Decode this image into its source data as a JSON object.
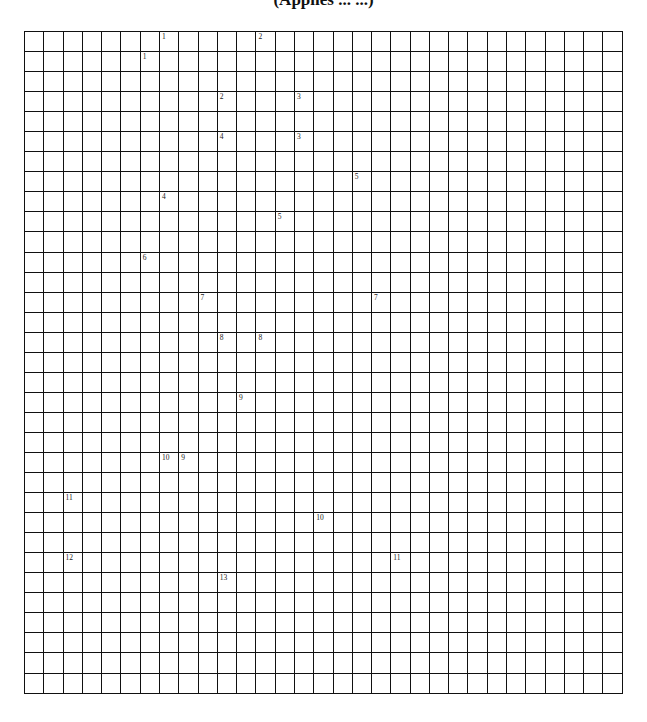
{
  "header": {
    "title": "(Applies ... ...)"
  },
  "puzzle": {
    "type": "crossword-grid",
    "columns": 31,
    "rows": 33,
    "numbers": [
      {
        "label": "1",
        "row": 0,
        "col": 7
      },
      {
        "label": "2",
        "row": 0,
        "col": 12
      },
      {
        "label": "1",
        "row": 1,
        "col": 6
      },
      {
        "label": "2",
        "row": 3,
        "col": 10
      },
      {
        "label": "3",
        "row": 3,
        "col": 14
      },
      {
        "label": "4",
        "row": 5,
        "col": 10
      },
      {
        "label": "3",
        "row": 5,
        "col": 14
      },
      {
        "label": "5",
        "row": 7,
        "col": 17
      },
      {
        "label": "4",
        "row": 8,
        "col": 7
      },
      {
        "label": "5",
        "row": 9,
        "col": 13
      },
      {
        "label": "6",
        "row": 11,
        "col": 6
      },
      {
        "label": "7",
        "row": 13,
        "col": 9
      },
      {
        "label": "7",
        "row": 13,
        "col": 18
      },
      {
        "label": "8",
        "row": 15,
        "col": 10
      },
      {
        "label": "8",
        "row": 15,
        "col": 12
      },
      {
        "label": "9",
        "row": 18,
        "col": 11
      },
      {
        "label": "10",
        "row": 21,
        "col": 7
      },
      {
        "label": "9",
        "row": 21,
        "col": 8
      },
      {
        "label": "11",
        "row": 23,
        "col": 2
      },
      {
        "label": "10",
        "row": 24,
        "col": 15
      },
      {
        "label": "12",
        "row": 26,
        "col": 2
      },
      {
        "label": "11",
        "row": 26,
        "col": 19
      },
      {
        "label": "13",
        "row": 27,
        "col": 10
      }
    ]
  }
}
